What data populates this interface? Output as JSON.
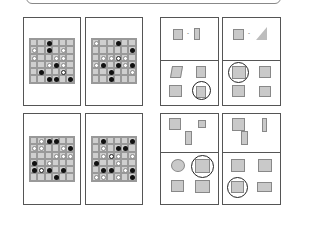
{
  "puzzles": {
    "go_boards": [
      {
        "id": "top-left",
        "size": 6,
        "stones": [
          [
            0,
            2,
            "b"
          ],
          [
            1,
            0,
            "w"
          ],
          [
            1,
            2,
            "b"
          ],
          [
            1,
            4,
            "w"
          ],
          [
            2,
            0,
            "w"
          ],
          [
            2,
            3,
            "w"
          ],
          [
            2,
            4,
            "w"
          ],
          [
            3,
            2,
            "w"
          ],
          [
            3,
            3,
            "b"
          ],
          [
            3,
            4,
            "w"
          ],
          [
            4,
            1,
            "b"
          ],
          [
            4,
            4,
            "r"
          ],
          [
            5,
            2,
            "b"
          ],
          [
            5,
            3,
            "b"
          ],
          [
            5,
            5,
            "b"
          ]
        ]
      },
      {
        "id": "top-right",
        "size": 6,
        "stones": [
          [
            0,
            0,
            "w"
          ],
          [
            0,
            3,
            "b"
          ],
          [
            1,
            5,
            "b"
          ],
          [
            2,
            1,
            "w"
          ],
          [
            2,
            2,
            "w"
          ],
          [
            2,
            3,
            "r"
          ],
          [
            2,
            4,
            "w"
          ],
          [
            3,
            0,
            "w"
          ],
          [
            3,
            1,
            "b"
          ],
          [
            3,
            3,
            "b"
          ],
          [
            3,
            4,
            "w"
          ],
          [
            3,
            5,
            "b"
          ],
          [
            4,
            2,
            "b"
          ],
          [
            4,
            5,
            "w"
          ],
          [
            5,
            2,
            "b"
          ]
        ]
      },
      {
        "id": "bottom-left",
        "size": 6,
        "stones": [
          [
            0,
            1,
            "w"
          ],
          [
            0,
            2,
            "b"
          ],
          [
            0,
            3,
            "b"
          ],
          [
            1,
            0,
            "w"
          ],
          [
            1,
            1,
            "w"
          ],
          [
            1,
            4,
            "w"
          ],
          [
            1,
            5,
            "b"
          ],
          [
            2,
            3,
            "w"
          ],
          [
            2,
            4,
            "w"
          ],
          [
            2,
            5,
            "w"
          ],
          [
            3,
            0,
            "b"
          ],
          [
            3,
            2,
            "w"
          ],
          [
            4,
            0,
            "b"
          ],
          [
            4,
            1,
            "r"
          ],
          [
            4,
            2,
            "b"
          ],
          [
            4,
            4,
            "b"
          ],
          [
            5,
            3,
            "b"
          ]
        ]
      },
      {
        "id": "bottom-right",
        "size": 6,
        "stones": [
          [
            0,
            1,
            "b"
          ],
          [
            0,
            5,
            "b"
          ],
          [
            1,
            1,
            "w"
          ],
          [
            1,
            3,
            "b"
          ],
          [
            1,
            4,
            "b"
          ],
          [
            2,
            1,
            "w"
          ],
          [
            2,
            2,
            "r"
          ],
          [
            2,
            3,
            "w"
          ],
          [
            2,
            5,
            "w"
          ],
          [
            3,
            0,
            "b"
          ],
          [
            3,
            3,
            "w"
          ],
          [
            4,
            1,
            "b"
          ],
          [
            4,
            2,
            "b"
          ],
          [
            4,
            4,
            "w"
          ],
          [
            4,
            5,
            "b"
          ],
          [
            5,
            0,
            "w"
          ],
          [
            5,
            1,
            "w"
          ],
          [
            5,
            3,
            "w"
          ],
          [
            5,
            5,
            "b"
          ]
        ]
      }
    ],
    "shape_puzzles": [
      {
        "id": "fold-1",
        "arrow": "→",
        "answer_index": 3
      },
      {
        "id": "fold-2",
        "arrow": "→",
        "answer_index": 0
      },
      {
        "id": "cut-1",
        "answer_index": 1
      },
      {
        "id": "cut-2",
        "answer_index": 2
      }
    ]
  },
  "colors": {
    "black_stone": "#111111",
    "white_stone": "#ffffff",
    "board": "#cfcfcf",
    "frame": "#555555"
  }
}
